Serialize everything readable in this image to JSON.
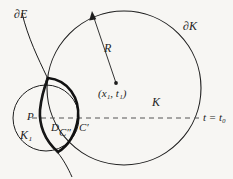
{
  "figure": {
    "background_color": "#f7f6f3",
    "stroke_color": "#1d1d1d",
    "labels": {
      "boundary_E": "∂E",
      "boundary_K": "∂K",
      "radius": "R",
      "center_point": "(x₁, t₁)",
      "region_K": "K",
      "region_K1": "K₁",
      "point_P": "P",
      "region_D": "D",
      "curve_C_double_prime": "C″",
      "curve_C_prime": "C′",
      "time_line": "t = t₀"
    },
    "elements": {
      "big_circle": {
        "cx": 124,
        "cy": 88,
        "r": 77,
        "name": "K"
      },
      "small_circle": {
        "cx": 46,
        "cy": 118,
        "r": 33,
        "name": "K1"
      },
      "center_dot": {
        "cx": 116,
        "cy": 83
      },
      "radius_arrow": {
        "x1": 116,
        "y1": 83,
        "x2": 92,
        "y2": 13
      },
      "dashed_line": {
        "x1": 33,
        "y1": 118,
        "x2": 200,
        "y2": 118
      }
    }
  }
}
